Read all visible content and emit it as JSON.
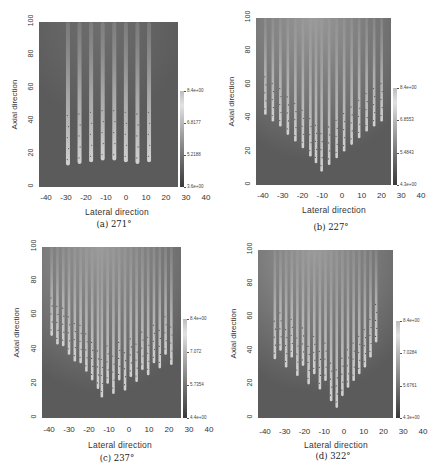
{
  "chart_data": [
    {
      "type": "heatmap",
      "title": "(a) 271°",
      "caption": "(a) 271°",
      "xlabel": "Lateral direction",
      "ylabel": "Axial direction",
      "xlim": [
        -45,
        40
      ],
      "ylim": [
        0,
        100
      ],
      "xticks": [
        "-40",
        "-30",
        "-20",
        "-10",
        "0",
        "10",
        "20",
        "30",
        "40"
      ],
      "yticks": [
        "0",
        "20",
        "40",
        "60",
        "80",
        "100"
      ],
      "colorbar": {
        "ticks": [
          "8.4e+00",
          "6.8177",
          "5.2188",
          "3.6e+00"
        ],
        "min": 3.6,
        "max": 8.4
      },
      "stripes": [
        {
          "x": -30,
          "tip": 13
        },
        {
          "x": -24,
          "tip": 14
        },
        {
          "x": -18,
          "tip": 15
        },
        {
          "x": -12,
          "tip": 16
        },
        {
          "x": -6,
          "tip": 16
        },
        {
          "x": 0,
          "tip": 15
        },
        {
          "x": 6,
          "tip": 14
        },
        {
          "x": 12,
          "tip": 15
        }
      ]
    },
    {
      "type": "heatmap",
      "title": "(b) 227°",
      "caption": "(b) 227°",
      "xlabel": "Lateral direction",
      "ylabel": "Axial direction",
      "xlim": [
        -45,
        40
      ],
      "ylim": [
        0,
        100
      ],
      "xticks": [
        "-40",
        "-30",
        "-20",
        "-10",
        "0",
        "10",
        "20",
        "30",
        "40"
      ],
      "yticks": [
        "0",
        "20",
        "40",
        "60",
        "80",
        "100"
      ],
      "colorbar": {
        "ticks": [
          "8.4e+00",
          "6.8553",
          "5.4843",
          "4.3e+00"
        ],
        "min": 4.3,
        "max": 8.4
      },
      "stripes": [
        {
          "x": -40,
          "tip": 42
        },
        {
          "x": -36,
          "tip": 38
        },
        {
          "x": -32,
          "tip": 35
        },
        {
          "x": -28,
          "tip": 30
        },
        {
          "x": -24,
          "tip": 26
        },
        {
          "x": -20,
          "tip": 22
        },
        {
          "x": -16,
          "tip": 17
        },
        {
          "x": -13,
          "tip": 13
        },
        {
          "x": -10,
          "tip": 8
        },
        {
          "x": -6,
          "tip": 12
        },
        {
          "x": -2,
          "tip": 16
        },
        {
          "x": 2,
          "tip": 20
        },
        {
          "x": 6,
          "tip": 24
        },
        {
          "x": 10,
          "tip": 28
        },
        {
          "x": 14,
          "tip": 32
        },
        {
          "x": 18,
          "tip": 35
        },
        {
          "x": 22,
          "tip": 38
        }
      ]
    },
    {
      "type": "heatmap",
      "title": "(c) 237°",
      "caption": "(c) 237°",
      "xlabel": "Lateral direction",
      "ylabel": "Axial direction",
      "xlim": [
        -45,
        40
      ],
      "ylim": [
        0,
        100
      ],
      "xticks": [
        "-40",
        "-30",
        "-20",
        "-10",
        "0",
        "10",
        "20",
        "30",
        "40"
      ],
      "yticks": [
        "0",
        "20",
        "40",
        "60",
        "80",
        "100"
      ],
      "colorbar": {
        "ticks": [
          "8.4e+00",
          "7.072",
          "5.7354",
          "4.4e+00"
        ],
        "min": 4.4,
        "max": 8.4
      },
      "stripes": [
        {
          "x": -40,
          "tip": 48
        },
        {
          "x": -37,
          "tip": 43
        },
        {
          "x": -34,
          "tip": 42
        },
        {
          "x": -31,
          "tip": 37
        },
        {
          "x": -28,
          "tip": 33
        },
        {
          "x": -25,
          "tip": 32
        },
        {
          "x": -22,
          "tip": 27
        },
        {
          "x": -19,
          "tip": 22
        },
        {
          "x": -16,
          "tip": 17
        },
        {
          "x": -14,
          "tip": 12
        },
        {
          "x": -11,
          "tip": 20
        },
        {
          "x": -8,
          "tip": 14
        },
        {
          "x": -5,
          "tip": 22
        },
        {
          "x": -2,
          "tip": 16
        },
        {
          "x": 1,
          "tip": 24
        },
        {
          "x": 4,
          "tip": 21
        },
        {
          "x": 7,
          "tip": 28
        },
        {
          "x": 10,
          "tip": 25
        },
        {
          "x": 13,
          "tip": 32
        },
        {
          "x": 16,
          "tip": 29
        },
        {
          "x": 19,
          "tip": 37
        },
        {
          "x": 22,
          "tip": 31
        }
      ]
    },
    {
      "type": "heatmap",
      "title": "(d) 322°",
      "caption": "(d) 322°",
      "xlabel": "Lateral direction",
      "ylabel": "Axial direction",
      "xlim": [
        -45,
        40
      ],
      "ylim": [
        0,
        100
      ],
      "xticks": [
        "-40",
        "-30",
        "-20",
        "-10",
        "0",
        "10",
        "20",
        "30",
        "40"
      ],
      "yticks": [
        "0",
        "20",
        "40",
        "60",
        "80",
        "100"
      ],
      "colorbar": {
        "ticks": [
          "8.4e+00",
          "7.0284",
          "5.6761",
          "4.3e+00"
        ],
        "min": 4.3,
        "max": 8.4
      },
      "stripes": [
        {
          "x": -36,
          "tip": 35
        },
        {
          "x": -33,
          "tip": 40
        },
        {
          "x": -30,
          "tip": 30
        },
        {
          "x": -27,
          "tip": 36
        },
        {
          "x": -24,
          "tip": 25
        },
        {
          "x": -21,
          "tip": 31
        },
        {
          "x": -18,
          "tip": 20
        },
        {
          "x": -15,
          "tip": 26
        },
        {
          "x": -12,
          "tip": 17
        },
        {
          "x": -9,
          "tip": 22
        },
        {
          "x": -6,
          "tip": 10
        },
        {
          "x": -3,
          "tip": 6
        },
        {
          "x": 0,
          "tip": 13
        },
        {
          "x": 3,
          "tip": 18
        },
        {
          "x": 6,
          "tip": 22
        },
        {
          "x": 9,
          "tip": 26
        },
        {
          "x": 12,
          "tip": 30
        },
        {
          "x": 15,
          "tip": 36
        },
        {
          "x": 18,
          "tip": 45
        }
      ]
    }
  ]
}
